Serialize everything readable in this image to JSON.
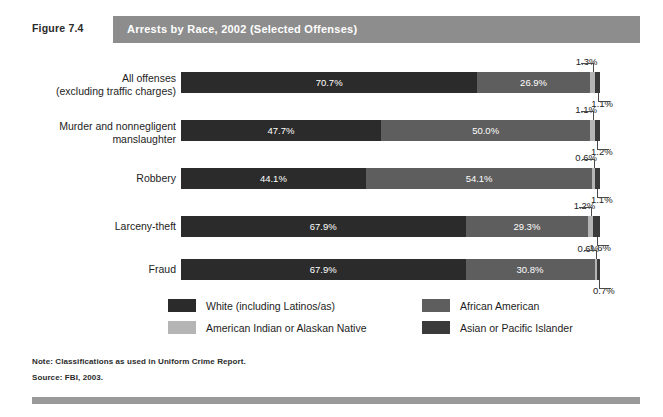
{
  "figure": {
    "label": "Figure 7.4",
    "title": "Arrests by Race, 2002 (Selected Offenses)"
  },
  "notes": {
    "note": "Note: Classifications as used in Uniform Crime Report.",
    "source": "Source: FBI, 2003."
  },
  "colors": {
    "white_seg": "#2b2b2b",
    "african_american_seg": "#5e5e5e",
    "american_indian_seg": "#b5b5b5",
    "asian_pacific_seg": "#3a3a3a",
    "title_bar": "#8d8d8d",
    "footer_bar": "#9a9a9a"
  },
  "legend": {
    "items": [
      {
        "label": "White (including Latinos/as)",
        "color": "#2b2b2b"
      },
      {
        "label": "African American",
        "color": "#5e5e5e"
      },
      {
        "label": "American Indian or Alaskan Native",
        "color": "#b5b5b5"
      },
      {
        "label": "Asian or Pacific Islander",
        "color": "#3a3a3a"
      }
    ]
  },
  "chart_data": {
    "type": "bar",
    "orientation": "horizontal",
    "stacked": true,
    "stack_total": 100,
    "title": "Arrests by Race, 2002 (Selected Offenses)",
    "xlabel": "",
    "ylabel": "",
    "xlim": [
      0,
      100
    ],
    "grid": false,
    "legend_position": "bottom",
    "value_suffix": "%",
    "categories": [
      "All offenses\n(excluding traffic charges)",
      "Murder and nonnegligent\nmanslaughter",
      "Robbery",
      "Larceny-theft",
      "Fraud"
    ],
    "series": [
      {
        "name": "White (including Latinos/as)",
        "values": [
          70.7,
          47.7,
          44.1,
          67.9,
          67.9
        ]
      },
      {
        "name": "African American",
        "values": [
          26.9,
          50.0,
          54.1,
          29.3,
          30.8
        ]
      },
      {
        "name": "American Indian or Alaskan Native",
        "values": [
          1.3,
          1.1,
          0.6,
          1.2,
          0.6
        ]
      },
      {
        "name": "Asian or Pacific Islander",
        "values": [
          1.1,
          1.2,
          1.1,
          1.6,
          0.7
        ]
      }
    ]
  },
  "rows": [
    {
      "label_line1": "All offenses",
      "label_line2": "(excluding traffic charges)",
      "segments": [
        {
          "name": "White (including Latinos/as)",
          "value": 70.7,
          "text": "70.7%",
          "inline": true
        },
        {
          "name": "African American",
          "value": 26.9,
          "text": "26.9%",
          "inline": true
        },
        {
          "name": "American Indian or Alaskan Native",
          "value": 1.3,
          "text": "1.3%",
          "inline": false
        },
        {
          "name": "Asian or Pacific Islander",
          "value": 1.1,
          "text": "1.1%",
          "inline": false
        }
      ]
    },
    {
      "label_line1": "Murder and nonnegligent",
      "label_line2": "manslaughter",
      "segments": [
        {
          "name": "White (including Latinos/as)",
          "value": 47.7,
          "text": "47.7%",
          "inline": true
        },
        {
          "name": "African American",
          "value": 50.0,
          "text": "50.0%",
          "inline": true
        },
        {
          "name": "American Indian or Alaskan Native",
          "value": 1.1,
          "text": "1.1%",
          "inline": false
        },
        {
          "name": "Asian or Pacific Islander",
          "value": 1.2,
          "text": "1.2%",
          "inline": false
        }
      ]
    },
    {
      "label_line1": "Robbery",
      "label_line2": "",
      "segments": [
        {
          "name": "White (including Latinos/as)",
          "value": 44.1,
          "text": "44.1%",
          "inline": true
        },
        {
          "name": "African American",
          "value": 54.1,
          "text": "54.1%",
          "inline": true
        },
        {
          "name": "American Indian or Alaskan Native",
          "value": 0.6,
          "text": "0.6%",
          "inline": false
        },
        {
          "name": "Asian or Pacific Islander",
          "value": 1.1,
          "text": "1.1%",
          "inline": false
        }
      ]
    },
    {
      "label_line1": "Larceny-theft",
      "label_line2": "",
      "segments": [
        {
          "name": "White (including Latinos/as)",
          "value": 67.9,
          "text": "67.9%",
          "inline": true
        },
        {
          "name": "African American",
          "value": 29.3,
          "text": "29.3%",
          "inline": true
        },
        {
          "name": "American Indian or Alaskan Native",
          "value": 1.2,
          "text": "1.2%",
          "inline": false
        },
        {
          "name": "Asian or Pacific Islander",
          "value": 1.6,
          "text": "1.6%",
          "inline": false
        }
      ]
    },
    {
      "label_line1": "Fraud",
      "label_line2": "",
      "segments": [
        {
          "name": "White (including Latinos/as)",
          "value": 67.9,
          "text": "67.9%",
          "inline": true
        },
        {
          "name": "African American",
          "value": 30.8,
          "text": "30.8%",
          "inline": true
        },
        {
          "name": "American Indian or Alaskan Native",
          "value": 0.6,
          "text": "0.6%",
          "inline": false
        },
        {
          "name": "Asian or Pacific Islander",
          "value": 0.7,
          "text": "0.7%",
          "inline": false
        }
      ]
    }
  ]
}
